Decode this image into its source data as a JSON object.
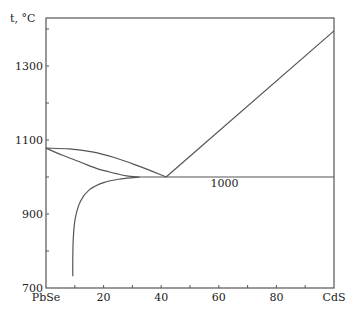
{
  "chart_data": {
    "type": "line",
    "title": "",
    "xlabel": "",
    "ylabel": "t, °C",
    "xlim": [
      0,
      100
    ],
    "ylim": [
      700,
      1430
    ],
    "x_ticks": [
      0,
      20,
      40,
      60,
      80,
      100
    ],
    "x_tick_labels": [
      "PbSe",
      "20",
      "40",
      "60",
      "80",
      "CdS"
    ],
    "x_minor_ticks": [
      10,
      30,
      50,
      70,
      90
    ],
    "y_ticks": [
      700,
      900,
      1100,
      1300
    ],
    "y_tick_labels": [
      "700",
      "900",
      "1100",
      "1300"
    ],
    "y_minor_ticks": [
      800,
      1000,
      1200,
      1400
    ],
    "grid": false,
    "legend": null,
    "annotations": [
      {
        "text": "1000",
        "x": 62,
        "y": 985
      }
    ],
    "series": [
      {
        "name": "liquidus-PbSe-side",
        "points": [
          [
            0,
            1078
          ],
          [
            8,
            1076
          ],
          [
            16,
            1068
          ],
          [
            24,
            1052
          ],
          [
            32,
            1030
          ],
          [
            38,
            1012
          ],
          [
            41.7,
            1000
          ]
        ]
      },
      {
        "name": "solidus-PbSe-side",
        "points": [
          [
            0,
            1078
          ],
          [
            6,
            1058
          ],
          [
            12,
            1040
          ],
          [
            18,
            1022
          ],
          [
            24,
            1010
          ],
          [
            28,
            1003
          ],
          [
            32.6,
            1000
          ]
        ]
      },
      {
        "name": "liquidus-CdS-side",
        "points": [
          [
            41.7,
            1000
          ],
          [
            100,
            1395
          ]
        ]
      },
      {
        "name": "eutectic-isotherm",
        "points": [
          [
            32.6,
            1000
          ],
          [
            100,
            1000
          ]
        ]
      },
      {
        "name": "solvus",
        "points": [
          [
            32.6,
            1000
          ],
          [
            26,
            995
          ],
          [
            20,
            985
          ],
          [
            15,
            965
          ],
          [
            12,
            935
          ],
          [
            10.2,
            890
          ],
          [
            9.5,
            840
          ],
          [
            9.3,
            780
          ],
          [
            9.3,
            732
          ]
        ]
      }
    ]
  }
}
